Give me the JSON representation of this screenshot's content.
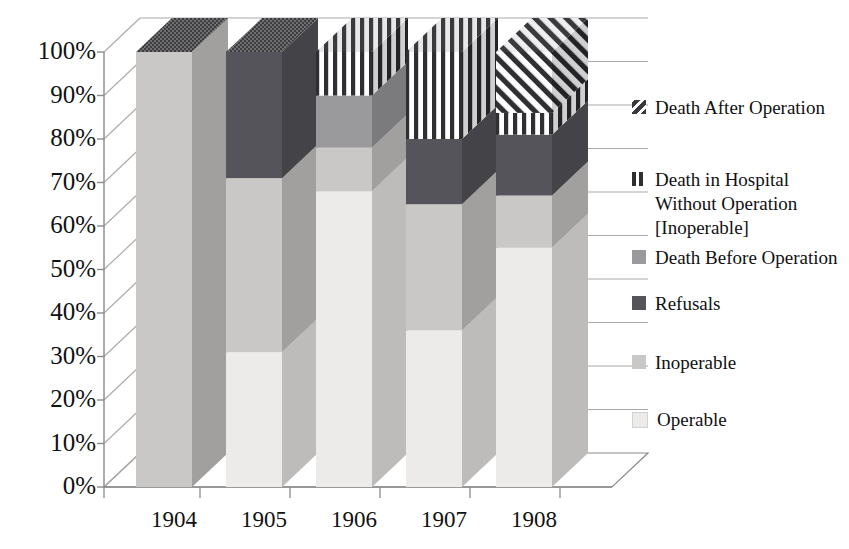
{
  "chart_data": {
    "type": "bar",
    "subtype": "stacked-100-percent-3d-column",
    "title": "",
    "xlabel": "",
    "ylabel": "",
    "categories": [
      "1904",
      "1905",
      "1906",
      "1907",
      "1908"
    ],
    "ylim": [
      0,
      100
    ],
    "ytick_labels": [
      "0%",
      "10%",
      "20%",
      "30%",
      "40%",
      "50%",
      "60%",
      "70%",
      "80%",
      "90%",
      "100%"
    ],
    "ytick_values": [
      0,
      10,
      20,
      30,
      40,
      50,
      60,
      70,
      80,
      90,
      100
    ],
    "grid": true,
    "legend_position": "right",
    "stack_order_bottom_to_top": [
      "Operable",
      "Inoperable",
      "Refusals",
      "Death Before Operation",
      "Death in Hospital Without Operation [Inoperable]",
      "Death After Operation"
    ],
    "series": [
      {
        "name": "Operable",
        "pattern": "solid",
        "color": "#ecebe9",
        "values": [
          0,
          31,
          68,
          36,
          55
        ]
      },
      {
        "name": "Inoperable",
        "pattern": "solid",
        "color": "#c9c8c6",
        "values": [
          100,
          40,
          10,
          29,
          12
        ]
      },
      {
        "name": "Refusals",
        "pattern": "solid",
        "color": "#55545a",
        "values": [
          0,
          29,
          0,
          15,
          14
        ]
      },
      {
        "name": "Death Before Operation",
        "pattern": "solid",
        "color": "#9a999c",
        "values": [
          0,
          0,
          12,
          0,
          0
        ]
      },
      {
        "name": "Death in Hospital Without Operation [Inoperable]",
        "pattern": "vertical-stripes",
        "color": "#2f2f33",
        "values": [
          0,
          0,
          10,
          20,
          5
        ]
      },
      {
        "name": "Death After Operation",
        "pattern": "diagonal-stripes",
        "color": "#2f2f33",
        "values": [
          0,
          0,
          0,
          0,
          14
        ]
      }
    ]
  },
  "legend": {
    "items": [
      {
        "label": "Death After Operation",
        "swatch": "diagonal-stripes-swatch",
        "color": "#3a3a3e"
      },
      {
        "label": "Death in Hospital Without Operation [Inoperable]",
        "swatch": "vertical-stripes-swatch",
        "color": "#2f2f33"
      },
      {
        "label": "Death Before Operation",
        "swatch": "solid-swatch",
        "color": "#9a999c"
      },
      {
        "label": "Refusals",
        "swatch": "solid-swatch",
        "color": "#55545a"
      },
      {
        "label": "Inoperable",
        "swatch": "solid-swatch",
        "color": "#c9c8c6"
      },
      {
        "label": "Operable",
        "swatch": "solid-swatch",
        "color": "#ecebe9"
      }
    ]
  },
  "axes": {
    "y_labels": [
      "100%",
      "90%",
      "80%",
      "70%",
      "60%",
      "50%",
      "40%",
      "30%",
      "20%",
      "10%",
      "0%"
    ],
    "x_labels": [
      "1904",
      "1905",
      "1906",
      "1907",
      "1908"
    ]
  },
  "colors": {
    "axis_line": "#8a8a8a",
    "grid_line": "#aaaaaa",
    "background": "#ffffff",
    "text": "#111111"
  }
}
